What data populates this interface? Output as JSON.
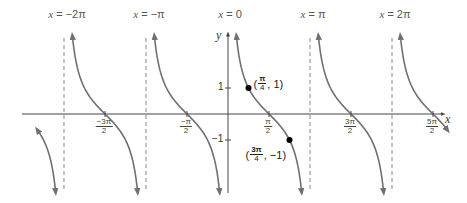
{
  "chart_data": {
    "type": "line",
    "title": "",
    "function": "y = cot(x)",
    "xlabel": "x",
    "ylabel": "y",
    "xlim": [
      -7.0,
      8.6
    ],
    "ylim": [
      -3.2,
      3.2
    ],
    "asymptotes": [
      {
        "x_label": "x = -2π",
        "value": -6.2832
      },
      {
        "x_label": "x = -π",
        "value": -3.1416
      },
      {
        "x_label": "x = 0",
        "value": 0
      },
      {
        "x_label": "x = π",
        "value": 3.1416
      },
      {
        "x_label": "x = 2π",
        "value": 6.2832
      }
    ],
    "x_ticks": [
      {
        "num": "−3π",
        "den": "2",
        "value": -4.7124
      },
      {
        "num": "−π",
        "den": "2",
        "value": -1.5708
      },
      {
        "num": "π",
        "den": "2",
        "value": 1.5708
      },
      {
        "num": "3π",
        "den": "2",
        "value": 4.7124
      },
      {
        "num": "5π",
        "den": "2",
        "value": 7.854
      }
    ],
    "y_ticks": [
      {
        "label": "1",
        "value": 1
      },
      {
        "label": "−1",
        "value": -1
      }
    ],
    "labeled_points": [
      {
        "num": "π",
        "den": "4",
        "y": "1",
        "x_value": 0.7854,
        "y_value": 1
      },
      {
        "num": "3π",
        "den": "4",
        "y": "−1",
        "x_value": 2.3562,
        "y_value": -1
      }
    ],
    "grid": false,
    "legend": null
  },
  "labels": {
    "asym": [
      {
        "pre": "x",
        "post": " = −2π"
      },
      {
        "pre": "x",
        "post": " = −π"
      },
      {
        "pre": "x",
        "post": " = 0"
      },
      {
        "pre": "x",
        "post": " = π"
      },
      {
        "pre": "x",
        "post": " = 2π"
      }
    ],
    "x_axis": "x",
    "y_axis": "y"
  }
}
